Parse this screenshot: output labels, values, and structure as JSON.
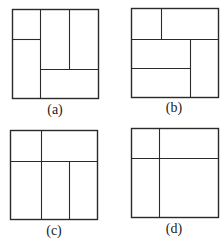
{
  "figure": {
    "panels": [
      {
        "label": "(a)",
        "box": {
          "x": 12,
          "y": 9,
          "w": 86,
          "h": 89
        },
        "lines": [
          {
            "x1": 40,
            "y1": 9,
            "x2": 40,
            "y2": 98
          },
          {
            "x1": 12,
            "y1": 39,
            "x2": 40,
            "y2": 39
          },
          {
            "x1": 69,
            "y1": 9,
            "x2": 69,
            "y2": 69
          },
          {
            "x1": 40,
            "y1": 69,
            "x2": 98,
            "y2": 69
          }
        ],
        "label_pos": {
          "x": 23,
          "y": 102
        }
      },
      {
        "label": "(b)",
        "box": {
          "x": 131,
          "y": 8,
          "w": 87,
          "h": 89
        },
        "lines": [
          {
            "x1": 161,
            "y1": 8,
            "x2": 161,
            "y2": 39
          },
          {
            "x1": 131,
            "y1": 39,
            "x2": 218,
            "y2": 39
          },
          {
            "x1": 190,
            "y1": 39,
            "x2": 190,
            "y2": 97
          },
          {
            "x1": 131,
            "y1": 68,
            "x2": 190,
            "y2": 68
          }
        ],
        "label_pos": {
          "x": 153,
          "y": 100
        }
      },
      {
        "label": "(c)",
        "box": {
          "x": 10,
          "y": 130,
          "w": 87,
          "h": 89
        },
        "lines": [
          {
            "x1": 41,
            "y1": 130,
            "x2": 41,
            "y2": 219
          },
          {
            "x1": 10,
            "y1": 161,
            "x2": 97,
            "y2": 161
          },
          {
            "x1": 69,
            "y1": 161,
            "x2": 69,
            "y2": 219
          }
        ],
        "label_pos": {
          "x": 32,
          "y": 223
        }
      },
      {
        "label": "(d)",
        "box": {
          "x": 131,
          "y": 128,
          "w": 87,
          "h": 89
        },
        "lines": [
          {
            "x1": 159,
            "y1": 128,
            "x2": 159,
            "y2": 217
          },
          {
            "x1": 131,
            "y1": 158,
            "x2": 218,
            "y2": 158
          }
        ],
        "label_pos": {
          "x": 152,
          "y": 221
        }
      }
    ],
    "stroke_color": "#2a2a2a"
  }
}
